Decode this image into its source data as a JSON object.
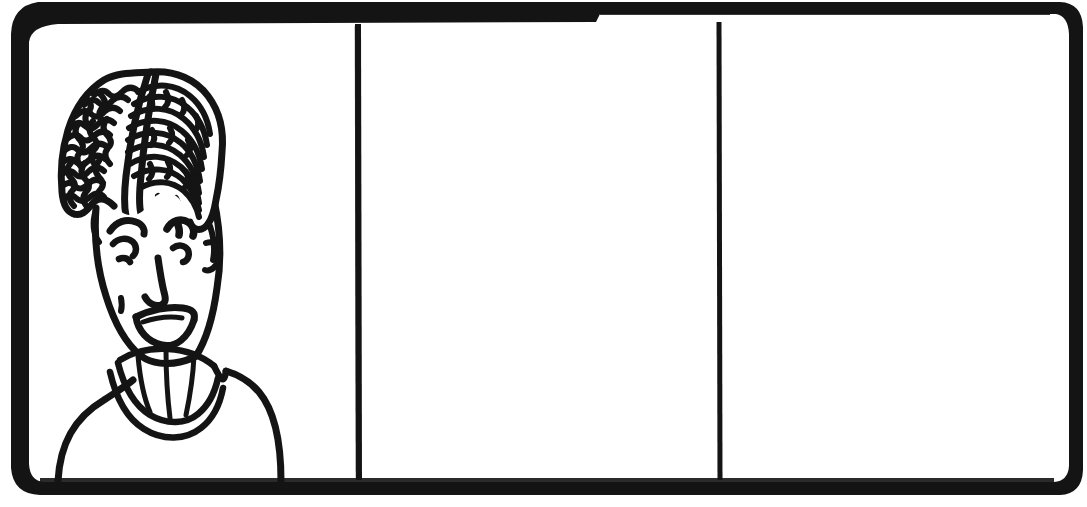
{
  "artwork": {
    "title": "Three-panel comic strip frame",
    "medium": "hand-drawn ink line art",
    "background_color": "#ffffff",
    "ink_color": "#111111",
    "canvas": {
      "width": 1087,
      "height": 507
    }
  },
  "frame": {
    "name": "outer-strip-border",
    "style": "thick hand-inked rounded rectangle",
    "corner_radius": "rounded",
    "top_border_thickness": "thick",
    "side_border_thickness": "thin",
    "notes": "top border steps slightly thicker toward the right side"
  },
  "panels": [
    {
      "index": 1,
      "name": "panel-1",
      "label": "Panel 1",
      "state": "illustrated",
      "content_summary": "Smiling person with tall voluminous textured hair and a high ribbed collar",
      "fill": "#ffffff"
    },
    {
      "index": 2,
      "name": "panel-2",
      "label": "Panel 2",
      "state": "empty",
      "content_summary": "Blank white panel",
      "fill": "#ffffff"
    },
    {
      "index": 3,
      "name": "panel-3",
      "label": "Panel 3",
      "state": "empty",
      "content_summary": "Blank white panel",
      "fill": "#ffffff"
    }
  ],
  "dividers": [
    {
      "name": "panel-divider-1",
      "between": "panel-1 and panel-2",
      "orientation": "vertical"
    },
    {
      "name": "panel-divider-2",
      "between": "panel-2 and panel-3",
      "orientation": "vertical"
    }
  ],
  "character": {
    "name": "smiling-figure",
    "expression": "smiling",
    "features": [
      {
        "name": "hair",
        "description": "large textured scribbled hair with center part"
      },
      {
        "name": "left-eyebrow",
        "description": "curved brow stroke"
      },
      {
        "name": "right-eyebrow",
        "description": "curved brow stroke"
      },
      {
        "name": "left-eye",
        "description": "squinting curved eye"
      },
      {
        "name": "right-eye",
        "description": "squinting curved eye"
      },
      {
        "name": "nose",
        "description": "hooked line nose"
      },
      {
        "name": "mouth",
        "description": "open smiling mouth with teeth line"
      },
      {
        "name": "ear",
        "description": "small curved ear on the right"
      },
      {
        "name": "collar",
        "description": "high ribbed collar with vertical stripes"
      },
      {
        "name": "shoulders",
        "description": "sloping shoulders and torso"
      }
    ]
  }
}
